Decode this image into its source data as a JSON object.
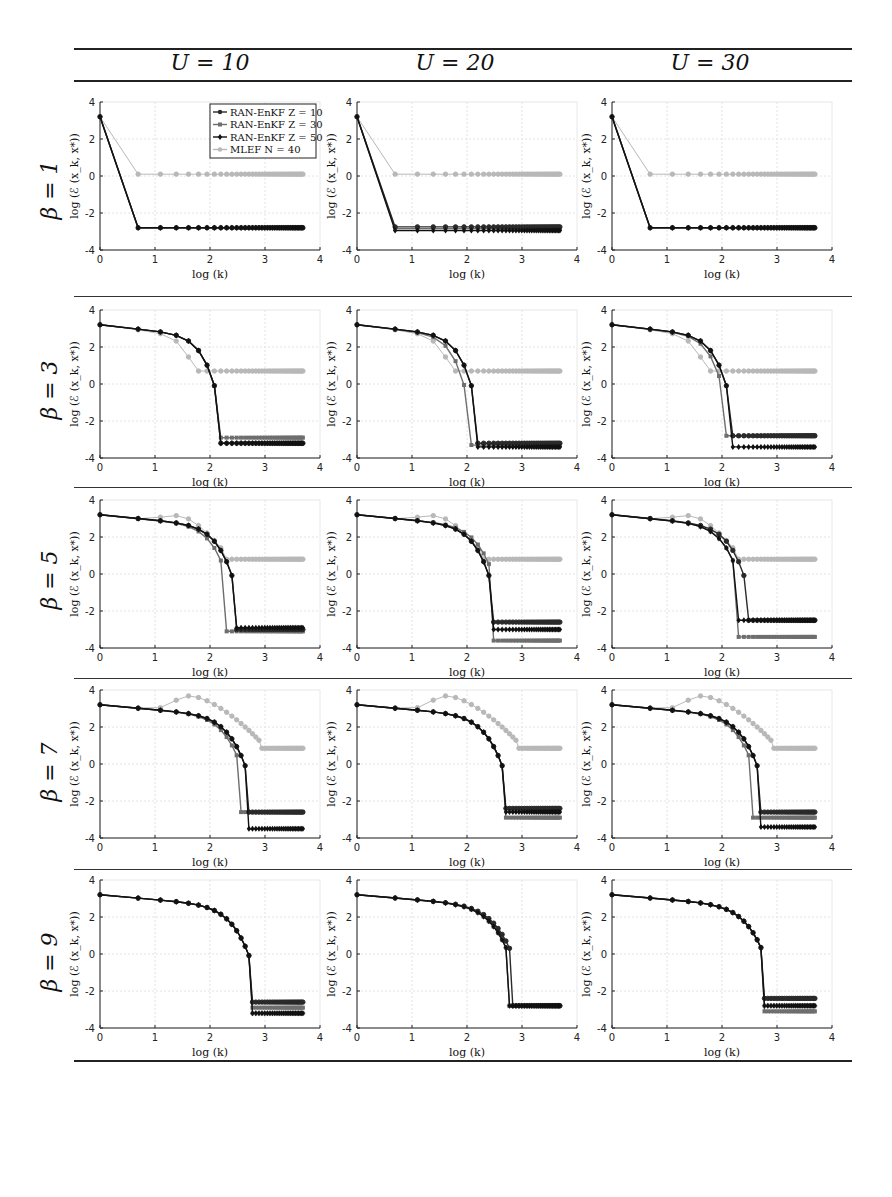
{
  "header": {
    "columns": [
      {
        "label": "U = 10"
      },
      {
        "label": "U = 20"
      },
      {
        "label": "U = 30"
      }
    ]
  },
  "rows": [
    {
      "label": "β = 1"
    },
    {
      "label": "β = 3"
    },
    {
      "label": "β = 5"
    },
    {
      "label": "β = 7"
    },
    {
      "label": "β = 9"
    }
  ],
  "axes": {
    "xlabel": "log (k)",
    "ylabel": "log (ℰ (x_k, x*))",
    "xticks": [
      "0",
      "1",
      "2",
      "3",
      "4"
    ],
    "yticks": [
      "4",
      "2",
      "0",
      "-2",
      "-4"
    ]
  },
  "legend": {
    "entries": [
      {
        "label": "RAN-EnKF Z = 10",
        "color": "#2a2a2a",
        "marker": "circle"
      },
      {
        "label": "RAN-EnKF Z = 30",
        "color": "#6e6e6e",
        "marker": "square"
      },
      {
        "label": "RAN-EnKF Z = 50",
        "color": "#111111",
        "marker": "diamond"
      },
      {
        "label": "MLEF N = 40",
        "color": "#b8b8b8",
        "marker": "circle"
      }
    ]
  },
  "chart_data": {
    "type": "line",
    "xlabel": "log (k)",
    "ylabel": "log (ℰ (x_k, x*))",
    "xlim": [
      0,
      4
    ],
    "ylim": [
      -4,
      4
    ],
    "grid": true,
    "legend_position": "upper right (first panel only)",
    "x_note": "x = ln(k), k = 1..40",
    "series_names": [
      "RAN-EnKF Z = 10",
      "RAN-EnKF Z = 30",
      "RAN-EnKF Z = 50",
      "MLEF N = 40"
    ],
    "panels": [
      {
        "row": "β = 1",
        "col": "U = 10",
        "series": [
          {
            "name": "RAN-EnKF Z = 10",
            "start": 3.2,
            "knee_x": 0.69,
            "knee_y": 3.2,
            "drop_x": 0.69,
            "final": -2.8
          },
          {
            "name": "RAN-EnKF Z = 30",
            "start": 3.2,
            "knee_x": 0.69,
            "knee_y": 3.2,
            "drop_x": 0.69,
            "final": -2.8
          },
          {
            "name": "RAN-EnKF Z = 50",
            "start": 3.2,
            "knee_x": 0.69,
            "knee_y": 3.2,
            "drop_x": 0.69,
            "final": -2.8
          },
          {
            "name": "MLEF N = 40",
            "start": 3.2,
            "drop_x": 0.69,
            "final": 0.1
          }
        ]
      },
      {
        "row": "β = 1",
        "col": "U = 20",
        "series": [
          {
            "name": "RAN-EnKF Z = 10",
            "start": 3.2,
            "drop_x": 0.69,
            "final": -2.75
          },
          {
            "name": "RAN-EnKF Z = 30",
            "start": 3.2,
            "drop_x": 0.69,
            "final": -2.85
          },
          {
            "name": "RAN-EnKF Z = 50",
            "start": 3.2,
            "drop_x": 0.69,
            "final": -2.95
          },
          {
            "name": "MLEF N = 40",
            "start": 3.2,
            "drop_x": 0.69,
            "final": 0.1
          }
        ]
      },
      {
        "row": "β = 1",
        "col": "U = 30",
        "series": [
          {
            "name": "RAN-EnKF Z = 10",
            "start": 3.2,
            "drop_x": 0.69,
            "final": -2.8
          },
          {
            "name": "RAN-EnKF Z = 30",
            "start": 3.2,
            "drop_x": 0.69,
            "final": -2.8
          },
          {
            "name": "RAN-EnKF Z = 50",
            "start": 3.2,
            "drop_x": 0.69,
            "final": -2.8
          },
          {
            "name": "MLEF N = 40",
            "start": 3.2,
            "drop_x": 0.69,
            "final": 0.1
          }
        ]
      },
      {
        "row": "β = 3",
        "col": "U = 10",
        "series": [
          {
            "name": "RAN-EnKF Z = 10",
            "start": 3.2,
            "drop_x": 2.08,
            "final": -3.2
          },
          {
            "name": "RAN-EnKF Z = 30",
            "start": 3.2,
            "drop_x": 2.08,
            "final": -2.9
          },
          {
            "name": "RAN-EnKF Z = 50",
            "start": 3.2,
            "drop_x": 2.08,
            "final": -3.2
          },
          {
            "name": "MLEF N = 40",
            "start": 3.2,
            "drop_x": 1.79,
            "final": 0.7
          }
        ]
      },
      {
        "row": "β = 3",
        "col": "U = 20",
        "series": [
          {
            "name": "RAN-EnKF Z = 10",
            "start": 3.2,
            "drop_x": 2.08,
            "final": -3.2
          },
          {
            "name": "RAN-EnKF Z = 30",
            "start": 3.2,
            "drop_x": 1.95,
            "final": -3.3
          },
          {
            "name": "RAN-EnKF Z = 50",
            "start": 3.2,
            "drop_x": 2.08,
            "final": -3.4
          },
          {
            "name": "MLEF N = 40",
            "start": 3.2,
            "drop_x": 1.79,
            "final": 0.7
          }
        ]
      },
      {
        "row": "β = 3",
        "col": "U = 30",
        "series": [
          {
            "name": "RAN-EnKF Z = 10",
            "start": 3.2,
            "drop_x": 2.08,
            "final": -2.8
          },
          {
            "name": "RAN-EnKF Z = 30",
            "start": 3.2,
            "drop_x": 2.0,
            "final": -2.8
          },
          {
            "name": "RAN-EnKF Z = 50",
            "start": 3.2,
            "drop_x": 2.08,
            "final": -3.4
          },
          {
            "name": "MLEF N = 40",
            "start": 3.2,
            "drop_x": 1.79,
            "final": 0.7
          }
        ]
      },
      {
        "row": "β = 5",
        "col": "U = 10",
        "series": [
          {
            "name": "RAN-EnKF Z = 10",
            "start": 3.2,
            "drop_x": 2.4,
            "final": -3.0
          },
          {
            "name": "RAN-EnKF Z = 30",
            "start": 3.2,
            "drop_x": 2.3,
            "final": -3.1
          },
          {
            "name": "RAN-EnKF Z = 50",
            "start": 3.2,
            "drop_x": 2.4,
            "final": -2.9
          },
          {
            "name": "MLEF N = 40",
            "start": 3.2,
            "peak_x": 1.39,
            "peak_y": 3.2,
            "drop_x": 2.3,
            "final": 0.8
          }
        ]
      },
      {
        "row": "β = 5",
        "col": "U = 20",
        "series": [
          {
            "name": "RAN-EnKF Z = 10",
            "start": 3.2,
            "drop_x": 2.4,
            "final": -2.6
          },
          {
            "name": "RAN-EnKF Z = 30",
            "start": 3.2,
            "drop_x": 2.48,
            "final": -3.6
          },
          {
            "name": "RAN-EnKF Z = 50",
            "start": 3.2,
            "drop_x": 2.4,
            "final": -3.0
          },
          {
            "name": "MLEF N = 40",
            "start": 3.2,
            "peak_x": 1.39,
            "peak_y": 3.2,
            "drop_x": 2.3,
            "final": 0.8
          }
        ]
      },
      {
        "row": "β = 5",
        "col": "U = 30",
        "series": [
          {
            "name": "RAN-EnKF Z = 10",
            "start": 3.2,
            "drop_x": 2.4,
            "final": -2.5
          },
          {
            "name": "RAN-EnKF Z = 30",
            "start": 3.2,
            "drop_x": 2.3,
            "final": -3.4
          },
          {
            "name": "RAN-EnKF Z = 50",
            "start": 3.2,
            "drop_x": 2.3,
            "final": -2.5
          },
          {
            "name": "MLEF N = 40",
            "start": 3.2,
            "peak_x": 1.39,
            "peak_y": 3.2,
            "drop_x": 2.3,
            "final": 0.8
          }
        ]
      },
      {
        "row": "β = 7",
        "col": "U = 10",
        "series": [
          {
            "name": "RAN-EnKF Z = 10",
            "start": 3.2,
            "drop_x": 2.64,
            "final": -2.6
          },
          {
            "name": "RAN-EnKF Z = 30",
            "start": 3.2,
            "drop_x": 2.56,
            "final": -2.6
          },
          {
            "name": "RAN-EnKF Z = 50",
            "start": 3.2,
            "drop_x": 2.64,
            "final": -3.5
          },
          {
            "name": "MLEF N = 40",
            "start": 3.2,
            "peak_x": 1.61,
            "peak_y": 3.7,
            "drop_x": 2.94,
            "final": 0.85
          }
        ]
      },
      {
        "row": "β = 7",
        "col": "U = 20",
        "series": [
          {
            "name": "RAN-EnKF Z = 10",
            "start": 3.2,
            "drop_x": 2.64,
            "final": -2.4
          },
          {
            "name": "RAN-EnKF Z = 30",
            "start": 3.2,
            "drop_x": 2.64,
            "final": -2.9
          },
          {
            "name": "RAN-EnKF Z = 50",
            "start": 3.2,
            "drop_x": 2.64,
            "final": -2.6
          },
          {
            "name": "MLEF N = 40",
            "start": 3.2,
            "peak_x": 1.61,
            "peak_y": 3.7,
            "drop_x": 2.94,
            "final": 0.85
          }
        ]
      },
      {
        "row": "β = 7",
        "col": "U = 30",
        "series": [
          {
            "name": "RAN-EnKF Z = 10",
            "start": 3.2,
            "drop_x": 2.64,
            "final": -2.6
          },
          {
            "name": "RAN-EnKF Z = 30",
            "start": 3.2,
            "drop_x": 2.56,
            "final": -2.9
          },
          {
            "name": "RAN-EnKF Z = 50",
            "start": 3.2,
            "drop_x": 2.64,
            "final": -3.4
          },
          {
            "name": "MLEF N = 40",
            "start": 3.2,
            "peak_x": 1.61,
            "peak_y": 3.7,
            "drop_x": 2.94,
            "final": 0.85
          }
        ]
      },
      {
        "row": "β = 9",
        "col": "U = 10",
        "series": [
          {
            "name": "RAN-EnKF Z = 10",
            "start": 3.2,
            "drop_x": 2.71,
            "final": -2.6
          },
          {
            "name": "RAN-EnKF Z = 30",
            "start": 3.2,
            "drop_x": 2.71,
            "final": -2.9
          },
          {
            "name": "RAN-EnKF Z = 50",
            "start": 3.2,
            "drop_x": 2.71,
            "final": -3.2
          },
          {
            "name": "MLEF N = 40",
            "start": 3.2,
            "drop_x": 2.71,
            "final": -3.2
          }
        ]
      },
      {
        "row": "β = 9",
        "col": "U = 20",
        "series": [
          {
            "name": "RAN-EnKF Z = 10",
            "start": 3.2,
            "drop_x": 2.83,
            "final": -2.8
          },
          {
            "name": "RAN-EnKF Z = 30",
            "start": 3.2,
            "drop_x": 2.77,
            "final": -2.8
          },
          {
            "name": "RAN-EnKF Z = 50",
            "start": 3.2,
            "drop_x": 2.77,
            "final": -2.8
          },
          {
            "name": "MLEF N = 40",
            "start": 3.2,
            "drop_x": 2.77,
            "final": -2.8
          }
        ]
      },
      {
        "row": "β = 9",
        "col": "U = 30",
        "series": [
          {
            "name": "RAN-EnKF Z = 10",
            "start": 3.2,
            "drop_x": 2.77,
            "final": -2.4
          },
          {
            "name": "RAN-EnKF Z = 30",
            "start": 3.2,
            "drop_x": 2.77,
            "final": -3.1
          },
          {
            "name": "RAN-EnKF Z = 50",
            "start": 3.2,
            "drop_x": 2.77,
            "final": -2.8
          },
          {
            "name": "MLEF N = 40",
            "start": 3.2,
            "drop_x": 2.77,
            "final": -2.8
          }
        ]
      }
    ]
  }
}
